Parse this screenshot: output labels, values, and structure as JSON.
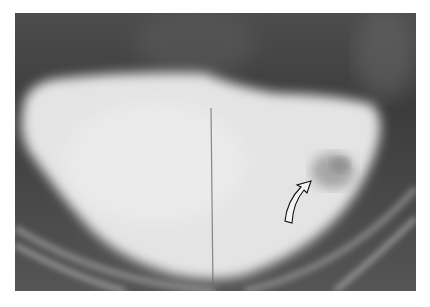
{
  "image": {
    "type": "radiograph",
    "subject": "contrast-filled bladder",
    "annotation": {
      "kind": "curved-arrow",
      "pointing_to": "filling defect",
      "position": {
        "x": 297,
        "y": 195
      }
    },
    "colors": {
      "background": "#ffffff",
      "soft_tissue": "#4a4a4a",
      "contrast": "#e6e6e6",
      "lesion": "#9a9a9a",
      "bone": "#bdbdbd"
    }
  }
}
